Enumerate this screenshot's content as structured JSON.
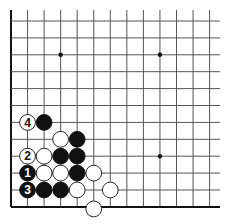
{
  "diagram": {
    "type": "go-problem",
    "grid": {
      "origin_x": 11,
      "origin_y": 21,
      "step_x": 16.55,
      "step_y": 16.9,
      "cols": 13,
      "rows": 12,
      "right_extent": 220,
      "top_extent": 10,
      "left_edge": true,
      "bottom_edge": true
    },
    "star_points": [
      [
        3,
        2
      ],
      [
        9,
        2
      ],
      [
        9,
        8
      ]
    ],
    "stones": [
      {
        "col": 1,
        "row": 6,
        "color": "white",
        "label": "4"
      },
      {
        "col": 2,
        "row": 6,
        "color": "black",
        "label": ""
      },
      {
        "col": 3,
        "row": 7,
        "color": "white",
        "label": ""
      },
      {
        "col": 4,
        "row": 7,
        "color": "black",
        "label": ""
      },
      {
        "col": 1,
        "row": 8,
        "color": "white",
        "label": "2"
      },
      {
        "col": 2,
        "row": 8,
        "color": "white",
        "label": ""
      },
      {
        "col": 3,
        "row": 8,
        "color": "black",
        "label": ""
      },
      {
        "col": 4,
        "row": 8,
        "color": "black",
        "label": ""
      },
      {
        "col": 1,
        "row": 9,
        "color": "black",
        "label": "1"
      },
      {
        "col": 2,
        "row": 9,
        "color": "white",
        "label": ""
      },
      {
        "col": 3,
        "row": 9,
        "color": "white",
        "label": ""
      },
      {
        "col": 4,
        "row": 9,
        "color": "black",
        "label": ""
      },
      {
        "col": 5,
        "row": 9,
        "color": "white",
        "label": ""
      },
      {
        "col": 1,
        "row": 10,
        "color": "black",
        "label": "3"
      },
      {
        "col": 2,
        "row": 10,
        "color": "black",
        "label": ""
      },
      {
        "col": 3,
        "row": 10,
        "color": "black",
        "label": ""
      },
      {
        "col": 4,
        "row": 10,
        "color": "white",
        "label": ""
      },
      {
        "col": 6,
        "row": 10,
        "color": "white",
        "label": ""
      },
      {
        "col": 5,
        "row": 11,
        "color": "white",
        "label": ""
      }
    ],
    "colors": {
      "line": "#555555",
      "edge": "#111111",
      "black": "#111111",
      "white": "#ffffff"
    }
  }
}
